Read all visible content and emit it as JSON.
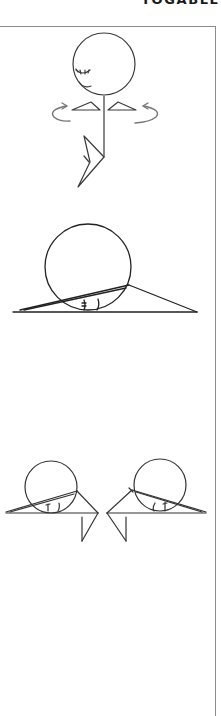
{
  "header": {
    "brand": "YOGABLE"
  },
  "colors": {
    "line": "#2a2a2a",
    "frame": "#8c8c8c",
    "arrow": "#6e6e6e",
    "background": "#ffffff"
  },
  "figures": [
    {
      "id": "standing-twist",
      "description": "Standing figure with closed eyes and smile, shoulders level, rotation arrows on both sides, one bent leg"
    },
    {
      "id": "side-lying-single",
      "description": "Circle resting on ground with triangle lines from hinge point"
    },
    {
      "id": "side-lying-pair",
      "description": "Two mirrored circle figures on ground with bent legs hanging below"
    }
  ]
}
